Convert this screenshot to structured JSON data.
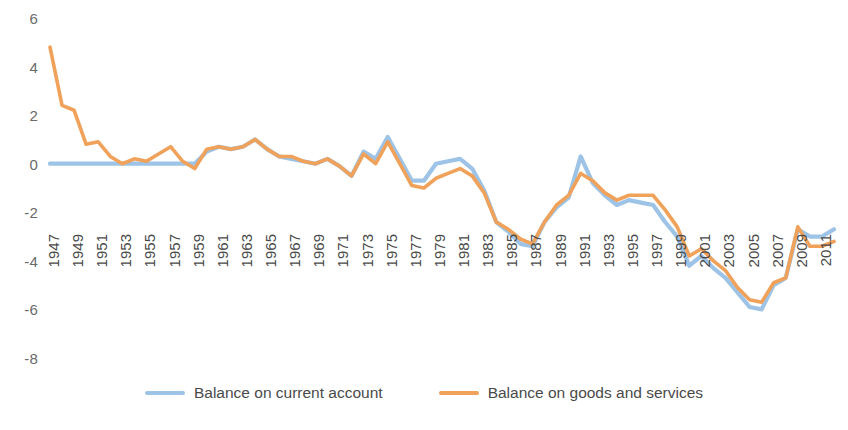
{
  "chart_data": {
    "type": "line",
    "title": "",
    "xlabel": "",
    "ylabel": "",
    "ylim": [
      -8,
      6
    ],
    "yticks": [
      6,
      4,
      2,
      0,
      -2,
      -4,
      -6,
      -8
    ],
    "grid": false,
    "legend_position": "bottom-center",
    "x": [
      1947,
      1948,
      1949,
      1950,
      1951,
      1952,
      1953,
      1954,
      1955,
      1956,
      1957,
      1958,
      1959,
      1960,
      1961,
      1962,
      1963,
      1964,
      1965,
      1966,
      1967,
      1968,
      1969,
      1970,
      1971,
      1972,
      1973,
      1974,
      1975,
      1976,
      1977,
      1978,
      1979,
      1980,
      1981,
      1982,
      1983,
      1984,
      1985,
      1986,
      1987,
      1988,
      1989,
      1990,
      1991,
      1992,
      1993,
      1994,
      1995,
      1996,
      1997,
      1998,
      1999,
      2000,
      2001,
      2002,
      2003,
      2004,
      2005,
      2006,
      2007,
      2008,
      2009,
      2010,
      2011,
      2012
    ],
    "xticks": [
      1947,
      1949,
      1951,
      1953,
      1955,
      1957,
      1959,
      1961,
      1963,
      1965,
      1967,
      1969,
      1971,
      1973,
      1975,
      1977,
      1979,
      1981,
      1983,
      1985,
      1987,
      1989,
      1991,
      1993,
      1995,
      1997,
      1999,
      2001,
      2003,
      2005,
      2007,
      2009,
      2011
    ],
    "series": [
      {
        "name": "Balance on current account",
        "color": "#9DC3E6",
        "values": [
          0.0,
          0.0,
          0.0,
          0.0,
          0.0,
          0.0,
          0.0,
          0.0,
          0.0,
          0.0,
          0.0,
          0.0,
          0.0,
          0.5,
          0.7,
          0.6,
          0.7,
          1.0,
          0.6,
          0.3,
          0.2,
          0.1,
          0.0,
          0.2,
          -0.1,
          -0.5,
          0.5,
          0.2,
          1.1,
          0.2,
          -0.7,
          -0.7,
          0.0,
          0.1,
          0.2,
          -0.2,
          -1.1,
          -2.4,
          -2.8,
          -3.3,
          -3.4,
          -2.4,
          -1.8,
          -1.4,
          0.3,
          -0.8,
          -1.3,
          -1.7,
          -1.5,
          -1.6,
          -1.7,
          -2.4,
          -3.0,
          -4.2,
          -3.8,
          -4.3,
          -4.7,
          -5.3,
          -5.9,
          -6.0,
          -5.0,
          -4.7,
          -2.7,
          -3.0,
          -3.0,
          -2.7
        ]
      },
      {
        "name": "Balance on goods and services",
        "color": "#F0A15A",
        "values": [
          4.8,
          2.4,
          2.2,
          0.8,
          0.9,
          0.3,
          0.0,
          0.2,
          0.1,
          0.4,
          0.7,
          0.1,
          -0.2,
          0.6,
          0.7,
          0.6,
          0.7,
          1.0,
          0.6,
          0.3,
          0.3,
          0.1,
          0.0,
          0.2,
          -0.1,
          -0.5,
          0.4,
          0.0,
          0.9,
          0.0,
          -0.9,
          -1.0,
          -0.6,
          -0.4,
          -0.2,
          -0.5,
          -1.2,
          -2.4,
          -2.7,
          -3.1,
          -3.3,
          -2.4,
          -1.7,
          -1.3,
          -0.4,
          -0.7,
          -1.2,
          -1.5,
          -1.3,
          -1.3,
          -1.3,
          -1.9,
          -2.6,
          -3.8,
          -3.5,
          -4.0,
          -4.4,
          -5.1,
          -5.6,
          -5.7,
          -4.9,
          -4.7,
          -2.6,
          -3.4,
          -3.4,
          -3.2
        ]
      }
    ]
  },
  "legend": {
    "items": [
      {
        "label": "Balance on current account",
        "color": "#9DC3E6"
      },
      {
        "label": "Balance on goods and services",
        "color": "#F0A15A"
      }
    ]
  }
}
